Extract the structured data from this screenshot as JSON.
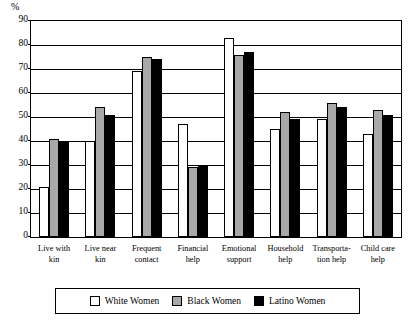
{
  "chart_data": {
    "type": "bar",
    "title": "",
    "xlabel": "",
    "ylabel": "%",
    "ylim": [
      0,
      90
    ],
    "ytick_step": 10,
    "yticks": [
      90,
      80,
      70,
      60,
      50,
      40,
      30,
      20,
      10,
      0
    ],
    "grid": true,
    "legend_position": "bottom",
    "categories": [
      "Live with kin",
      "Live near kin",
      "Frequent contact",
      "Financial help",
      "Emotional support",
      "Household help",
      "Transporta-tion help",
      "Child care help"
    ],
    "category_lines": [
      [
        "Live with",
        "kin"
      ],
      [
        "Live near",
        "kin"
      ],
      [
        "Frequent",
        "contact"
      ],
      [
        "Financial",
        "help"
      ],
      [
        "Emotional",
        "support"
      ],
      [
        "Household",
        "help"
      ],
      [
        "Transporta-",
        "tion help"
      ],
      [
        "Child care",
        "help"
      ]
    ],
    "series": [
      {
        "name": "White Women",
        "color": "#ffffff",
        "values": [
          21,
          40,
          69,
          47,
          83,
          45,
          49,
          43
        ]
      },
      {
        "name": "Black Women",
        "color": "#a8a8a8",
        "values": [
          41,
          54,
          75,
          29,
          76,
          52,
          56,
          53
        ]
      },
      {
        "name": "Latino Women",
        "color": "#000000",
        "values": [
          40,
          51,
          74,
          30,
          77,
          49,
          54,
          51
        ]
      }
    ]
  },
  "legend": {
    "items": [
      {
        "label": "White Women",
        "swatch": "white"
      },
      {
        "label": "Black Women",
        "swatch": "gray"
      },
      {
        "label": "Latino Women",
        "swatch": "black"
      }
    ]
  }
}
